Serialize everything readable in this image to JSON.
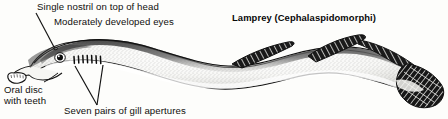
{
  "figure": {
    "title": "Lamprey (Cephalaspidomorphi)"
  },
  "labels": {
    "nostril": "Single nostril on top of head",
    "eyes": "Moderately developed eyes",
    "oral_disc_line1": "Oral disc",
    "oral_disc_line2": "with teeth",
    "gill_apertures": "Seven pairs of gill apertures"
  },
  "anatomy": {
    "gill_slit_count": 7,
    "dorsal_fin_count": 2,
    "caudal_fin": "fan-shaped",
    "eye": "single-lateral-eye"
  },
  "colors": {
    "ink": "#111111",
    "paper": "#fdfdfb",
    "shading": "#2b2b2b",
    "stipple": "#555555"
  }
}
